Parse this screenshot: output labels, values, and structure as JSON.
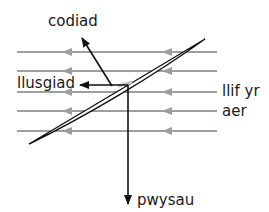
{
  "diagram": {
    "labels": {
      "lift": "codiad",
      "drag": "llusgiad",
      "airflow_line1": "llif yr",
      "airflow_line2": "aer",
      "weight": "pwysau"
    },
    "airflow": {
      "line_count": 5,
      "direction": "right-to-left",
      "color": "#9e9e9e"
    },
    "forces": [
      {
        "name": "lift",
        "label_key": "codiad",
        "direction": "up-left"
      },
      {
        "name": "drag",
        "label_key": "llusgiad",
        "direction": "left"
      },
      {
        "name": "weight",
        "label_key": "pwysau",
        "direction": "down"
      }
    ],
    "colors": {
      "force_arrow": "#111111",
      "airflow": "#9e9e9e",
      "wing_outline": "#111111",
      "wing_fill": "#ffffff"
    }
  }
}
